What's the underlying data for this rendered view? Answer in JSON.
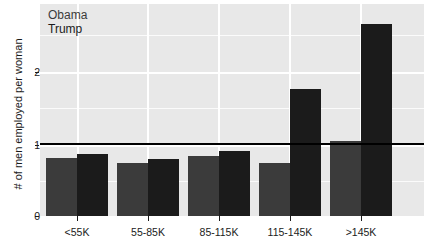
{
  "chart_data": {
    "type": "bar",
    "title": "",
    "subtitle": "",
    "xlabel": "",
    "ylabel": "# of men employed per woman",
    "categories": [
      "<55K",
      "55-85K",
      "85-115K",
      "115-145K",
      ">145K"
    ],
    "series": [
      {
        "name": "Obama",
        "color": "#3b3b3b",
        "values": [
          0.8,
          0.73,
          0.83,
          0.73,
          1.04
        ]
      },
      {
        "name": "Trump",
        "color": "#1b1b1b",
        "values": [
          0.86,
          0.79,
          0.9,
          1.76,
          2.66
        ]
      }
    ],
    "ylim": [
      0,
      2.9
    ],
    "yticks": [
      0,
      1,
      2
    ],
    "ytick_labels": [
      "0",
      "1",
      "2"
    ],
    "grid": true,
    "grid_color": "#ffffff",
    "panel_background": "#e8e8e8",
    "legend_position": "top-left",
    "annotations": [
      {
        "name": "reference-line",
        "type": "hline",
        "y": 1,
        "color": "#000000"
      }
    ]
  },
  "legend": {
    "obama": "Obama",
    "trump": "Trump"
  },
  "axes": {
    "y_title": "# of men employed per woman",
    "y_ticks": [
      "2",
      "1",
      "0"
    ],
    "x_ticks": [
      "<55K",
      "55-85K",
      "85-115K",
      "115-145K",
      ">145K"
    ]
  }
}
